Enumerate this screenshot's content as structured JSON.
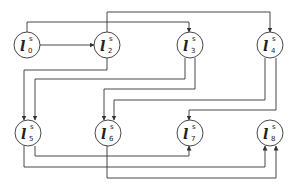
{
  "diagram": {
    "stroke_color": "#333333",
    "nodes": [
      {
        "id": "l0",
        "base": "l",
        "sup": "s",
        "sub": "0",
        "cx": 27,
        "cy": 45
      },
      {
        "id": "l2",
        "base": "l",
        "sup": "s",
        "sub": "2",
        "cx": 107,
        "cy": 45
      },
      {
        "id": "l3",
        "base": "l",
        "sup": "s",
        "sub": "3",
        "cx": 190,
        "cy": 45
      },
      {
        "id": "l4",
        "base": "l",
        "sup": "s",
        "sub": "4",
        "cx": 270,
        "cy": 45
      },
      {
        "id": "l5",
        "base": "l",
        "sup": "s",
        "sub": "5",
        "cx": 28,
        "cy": 133
      },
      {
        "id": "l6",
        "base": "l",
        "sup": "s",
        "sub": "6",
        "cx": 108,
        "cy": 133
      },
      {
        "id": "l7",
        "base": "l",
        "sup": "s",
        "sub": "7",
        "cx": 190,
        "cy": 133
      },
      {
        "id": "l8",
        "base": "l",
        "sup": "s",
        "sub": "8",
        "cx": 270,
        "cy": 133
      }
    ],
    "edges": [
      {
        "from": "l0",
        "to": "l2"
      },
      {
        "from": "l0",
        "to": "l3"
      },
      {
        "from": "l2",
        "to": "l4"
      },
      {
        "from": "l2",
        "to": "l5"
      },
      {
        "from": "l3",
        "to": "l5"
      },
      {
        "from": "l3",
        "to": "l6"
      },
      {
        "from": "l4",
        "to": "l6"
      },
      {
        "from": "l4",
        "to": "l7"
      },
      {
        "from": "l5",
        "to": "l7"
      },
      {
        "from": "l5",
        "to": "l8"
      },
      {
        "from": "l6",
        "to": "l8"
      }
    ]
  }
}
